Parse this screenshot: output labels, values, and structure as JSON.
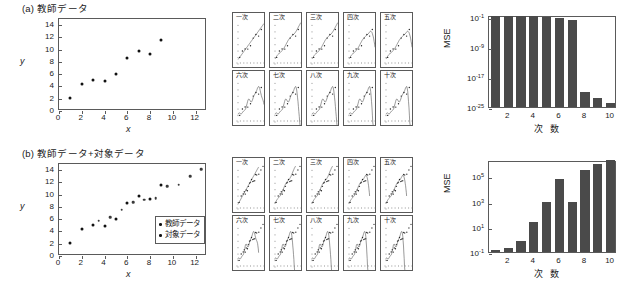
{
  "figure": {
    "panels": [
      {
        "id": "a",
        "title": "(a) 教師データ",
        "scatter": {
          "xlabel": "x",
          "ylabel": "y",
          "xlim": [
            0,
            13
          ],
          "ylim": [
            0,
            15
          ],
          "xticks": [
            0,
            2,
            4,
            6,
            8,
            10,
            12
          ],
          "yticks": [
            0,
            2,
            4,
            6,
            8,
            10,
            12,
            14
          ],
          "series": [
            {
              "name": "教師データ",
              "x": [
                1,
                2,
                3,
                4,
                5,
                6,
                7,
                8,
                9
              ],
              "y": [
                2.2,
                4.35,
                5.05,
                4.95,
                6.1,
                8.65,
                9.85,
                9.3,
                11.5
              ]
            }
          ],
          "legend": null
        },
        "thumbnails": [
          "一次",
          "二次",
          "三次",
          "四次",
          "五次",
          "六次",
          "七次",
          "八次",
          "九次",
          "十次"
        ],
        "mse": {
          "type": "bar",
          "title": "",
          "xlabel": "次 数",
          "ylabel": "MSE",
          "log": true,
          "ylim": [
            1e-25,
            0.3
          ],
          "yticks": [
            "10⁻¹",
            "10⁻⁹",
            "10⁻¹⁷",
            "10⁻²⁵"
          ],
          "ytick_exponents": [
            -1,
            -9,
            -17,
            -25
          ],
          "xticks": [
            2,
            4,
            6,
            8,
            10
          ],
          "categories": [
            1,
            2,
            3,
            4,
            5,
            6,
            7,
            8,
            9,
            10
          ],
          "values": [
            0.13,
            0.13,
            0.13,
            0.13,
            0.08,
            0.04,
            0.015,
            1e-21,
            2e-23,
            1e-24
          ]
        }
      },
      {
        "id": "b",
        "title": "(b) 教師データ+対象データ",
        "scatter": {
          "xlabel": "x",
          "ylabel": "y",
          "xlim": [
            0,
            13
          ],
          "ylim": [
            0,
            15
          ],
          "xticks": [
            0,
            2,
            4,
            6,
            8,
            10,
            12
          ],
          "yticks": [
            0,
            2,
            4,
            6,
            8,
            10,
            12,
            14
          ],
          "series": [
            {
              "name": "教師データ",
              "x": [
                1,
                2,
                3,
                4,
                5,
                6,
                7,
                8,
                9
              ],
              "y": [
                2.2,
                4.35,
                5.05,
                4.95,
                6.1,
                8.65,
                9.85,
                9.3,
                11.5
              ]
            },
            {
              "name": "対象データ",
              "x": [
                3.5,
                4.5,
                5.5,
                6.5,
                7.5,
                8.5,
                9.5,
                10.5,
                11.5,
                12.5
              ],
              "y": [
                5.75,
                6.35,
                7.55,
                8.8,
                9.15,
                9.4,
                11.35,
                11.6,
                13.0,
                14.2
              ]
            }
          ],
          "legend": {
            "items": [
              "教師データ",
              "対象データ"
            ]
          }
        },
        "thumbnails": [
          "一次",
          "二次",
          "三次",
          "四次",
          "五次",
          "六次",
          "七次",
          "八次",
          "九次",
          "十次"
        ],
        "mse": {
          "type": "bar",
          "title": "",
          "xlabel": "次 数",
          "ylabel": "MSE",
          "log": true,
          "ylim": [
            0.1,
            2000000.0
          ],
          "yticks": [
            "10⁵",
            "10³",
            "10¹",
            "10⁻¹"
          ],
          "ytick_exponents": [
            5,
            3,
            1,
            -1
          ],
          "xticks": [
            2,
            4,
            6,
            8,
            10
          ],
          "categories": [
            1,
            2,
            3,
            4,
            5,
            6,
            7,
            8,
            9,
            10
          ],
          "values": [
            0.15,
            0.22,
            0.7,
            25,
            1000.0,
            60000.0,
            1000.0,
            300000.0,
            1000000.0,
            2000000.0
          ]
        }
      }
    ]
  }
}
